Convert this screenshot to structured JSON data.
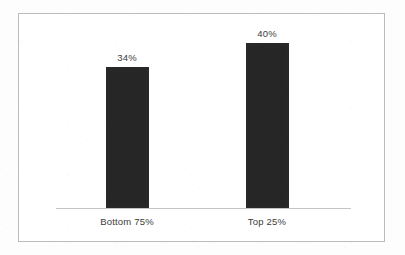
{
  "chart_data": {
    "type": "bar",
    "title": "",
    "subtitle": "",
    "xlabel": "",
    "ylabel": "",
    "categories": [
      "Bottom 75%",
      "Top 25%"
    ],
    "values": [
      34,
      40
    ],
    "value_labels": [
      "34%",
      "40%"
    ],
    "ylim": [
      0,
      47
    ],
    "grid": false,
    "legend": null,
    "series": [
      {
        "name": "",
        "values": [
          34,
          40
        ]
      }
    ],
    "annotations": []
  },
  "style": {
    "bar_color": "#262626",
    "frame_color": "#b9bcbe",
    "axis_color": "#c2c4c6",
    "text_color": "#3c3c3c",
    "background": "#ffffff"
  }
}
